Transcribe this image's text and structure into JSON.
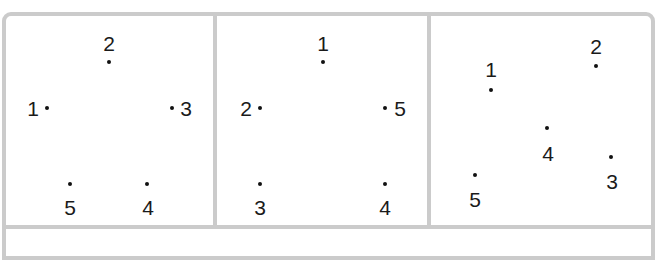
{
  "figure": {
    "border_color": "#cbcbcb",
    "dot_color": "#111111",
    "panels": [
      {
        "name": "panel-1",
        "points": [
          {
            "label": "1",
            "dot": [
              47,
              108
            ],
            "text": [
              33,
              108
            ]
          },
          {
            "label": "2",
            "dot": [
              109,
              62
            ],
            "text": [
              109,
              43
            ]
          },
          {
            "label": "3",
            "dot": [
              172,
              108
            ],
            "text": [
              186,
              108
            ]
          },
          {
            "label": "4",
            "dot": [
              147,
              184
            ],
            "text": [
              148,
              207
            ]
          },
          {
            "label": "5",
            "dot": [
              70,
              184
            ],
            "text": [
              70,
              207
            ]
          }
        ]
      },
      {
        "name": "panel-2",
        "points": [
          {
            "label": "1",
            "dot": [
              323,
              62
            ],
            "text": [
              323,
              43
            ]
          },
          {
            "label": "2",
            "dot": [
              260,
              108
            ],
            "text": [
              246,
              108
            ]
          },
          {
            "label": "3",
            "dot": [
              260,
              184
            ],
            "text": [
              260,
              207
            ]
          },
          {
            "label": "4",
            "dot": [
              385,
              184
            ],
            "text": [
              385,
              207
            ]
          },
          {
            "label": "5",
            "dot": [
              385,
              108
            ],
            "text": [
              400,
              108
            ]
          }
        ]
      },
      {
        "name": "panel-3",
        "points": [
          {
            "label": "1",
            "dot": [
              491,
              90
            ],
            "text": [
              491,
              69
            ]
          },
          {
            "label": "2",
            "dot": [
              596,
              66
            ],
            "text": [
              596,
              46
            ]
          },
          {
            "label": "3",
            "dot": [
              611,
              157
            ],
            "text": [
              612,
              181
            ]
          },
          {
            "label": "4",
            "dot": [
              547,
              128
            ],
            "text": [
              548,
              153
            ]
          },
          {
            "label": "5",
            "dot": [
              475,
              175
            ],
            "text": [
              475,
              199
            ]
          }
        ]
      }
    ]
  }
}
